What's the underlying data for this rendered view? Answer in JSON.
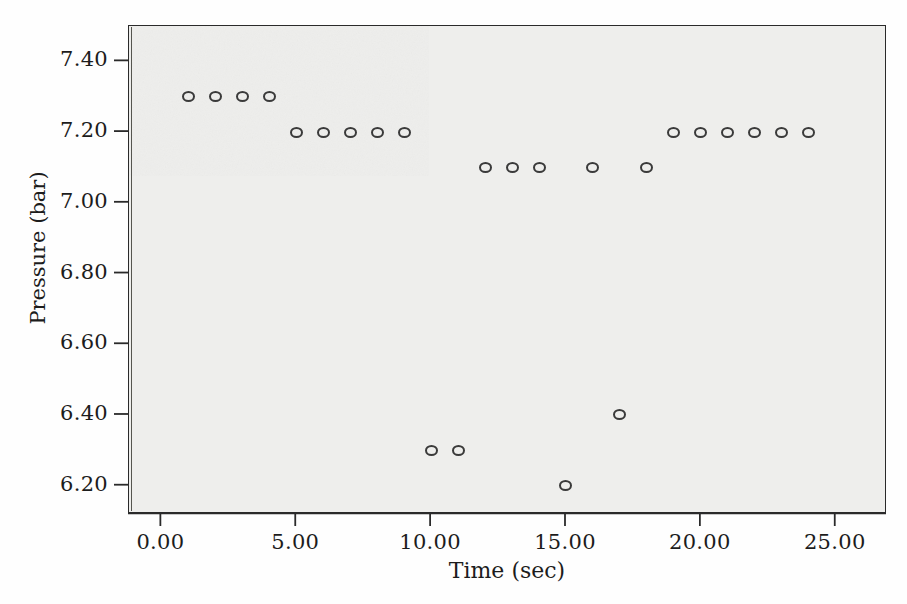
{
  "figure": {
    "background_color": "#fefefe",
    "plot_background_color": "#eeeeec",
    "frame_color": "#2a2a2a",
    "marker_color": "#3a3a3a"
  },
  "axes": {
    "y_title": "Pressure (bar)",
    "x_title": "Time (sec)",
    "y_ticks": [
      "7.40",
      "7.20",
      "7.00",
      "6.80",
      "6.60",
      "6.40",
      "6.20"
    ],
    "x_ticks": [
      "0.00",
      "5.00",
      "10.00",
      "15.00",
      "20.00",
      "25.00"
    ]
  },
  "chart_data": {
    "type": "scatter",
    "title": "",
    "xlabel": "Time (sec)",
    "ylabel": "Pressure (bar)",
    "xlim": [
      -1.2,
      26.9
    ],
    "ylim": [
      6.12,
      7.5
    ],
    "grid": false,
    "legend": null,
    "marker_style": "open-circle",
    "x": [
      1,
      2,
      3,
      4,
      5,
      6,
      7,
      8,
      9,
      10,
      11,
      12,
      13,
      14,
      15,
      16,
      17,
      18,
      19,
      20,
      21,
      22,
      23,
      24
    ],
    "y": [
      7.3,
      7.3,
      7.3,
      7.3,
      7.2,
      7.2,
      7.2,
      7.2,
      7.2,
      6.3,
      6.3,
      7.1,
      7.1,
      7.1,
      6.2,
      7.1,
      6.4,
      7.1,
      7.2,
      7.2,
      7.2,
      7.2,
      7.2,
      7.2
    ],
    "points": [
      {
        "x": 1,
        "y": 7.3
      },
      {
        "x": 2,
        "y": 7.3
      },
      {
        "x": 3,
        "y": 7.3
      },
      {
        "x": 4,
        "y": 7.3
      },
      {
        "x": 5,
        "y": 7.2
      },
      {
        "x": 6,
        "y": 7.2
      },
      {
        "x": 7,
        "y": 7.2
      },
      {
        "x": 8,
        "y": 7.2
      },
      {
        "x": 9,
        "y": 7.2
      },
      {
        "x": 10,
        "y": 6.3
      },
      {
        "x": 11,
        "y": 6.3
      },
      {
        "x": 12,
        "y": 7.1
      },
      {
        "x": 13,
        "y": 7.1
      },
      {
        "x": 14,
        "y": 7.1
      },
      {
        "x": 15,
        "y": 6.2
      },
      {
        "x": 16,
        "y": 7.1
      },
      {
        "x": 17,
        "y": 6.4
      },
      {
        "x": 18,
        "y": 7.1
      },
      {
        "x": 19,
        "y": 7.2
      },
      {
        "x": 20,
        "y": 7.2
      },
      {
        "x": 21,
        "y": 7.2
      },
      {
        "x": 22,
        "y": 7.2
      },
      {
        "x": 23,
        "y": 7.2
      },
      {
        "x": 24,
        "y": 7.2
      }
    ]
  }
}
